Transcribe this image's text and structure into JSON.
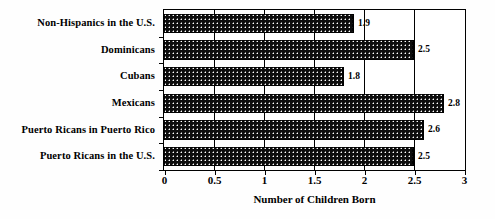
{
  "chart_data": {
    "type": "bar",
    "orientation": "horizontal",
    "title": "",
    "subtitle": "",
    "xlabel": "Number of Children Born",
    "ylabel": "",
    "xlim": [
      0,
      3
    ],
    "xticks": [
      "0",
      "0.5",
      "1",
      "1.5",
      "2",
      "2.5",
      "3"
    ],
    "xtick_values": [
      0,
      0.5,
      1,
      1.5,
      2,
      2.5,
      3
    ],
    "grid": true,
    "grid_axis": "x",
    "legend": false,
    "legend_position": "none",
    "bar_fill": "#0d0d0d",
    "bar_pattern": "white-dots-on-black",
    "categories": [
      "Non-Hispanics in the U.S.",
      "Dominicans",
      "Cubans",
      "Mexicans",
      "Puerto Ricans in Puerto Rico",
      "Puerto Ricans in the U.S."
    ],
    "values": [
      1.9,
      2.5,
      1.8,
      2.8,
      2.6,
      2.5
    ],
    "data_labels": [
      "1.9",
      "2.5",
      "1.8",
      "2.8",
      "2.6",
      "2.5"
    ],
    "series": [
      {
        "name": "Number of Children Born",
        "values": [
          1.9,
          2.5,
          1.8,
          2.8,
          2.6,
          2.5
        ]
      }
    ]
  }
}
